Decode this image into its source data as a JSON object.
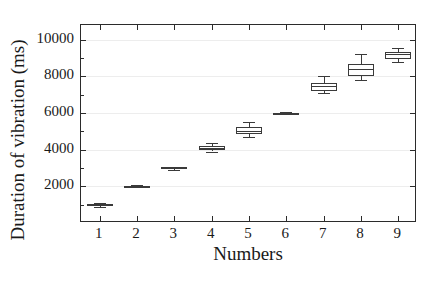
{
  "chart_data": {
    "type": "box",
    "title": "",
    "xlabel": "Numbers",
    "ylabel": "Duration of vibration (ms)",
    "categories": [
      "1",
      "2",
      "3",
      "4",
      "5",
      "6",
      "7",
      "8",
      "9"
    ],
    "xlim": [
      0.5,
      9.5
    ],
    "ylim": [
      0,
      10800
    ],
    "grid": true,
    "legend": null,
    "y_ticks": [
      {
        "value": 2000,
        "label": "2000"
      },
      {
        "value": 4000,
        "label": "4000"
      },
      {
        "value": 6000,
        "label": "6000"
      },
      {
        "value": 8000,
        "label": "8000"
      },
      {
        "value": 10000,
        "label": "10000"
      }
    ],
    "y_minor_ticks": [
      1000,
      3000,
      5000,
      7000,
      9000
    ],
    "boxes": [
      {
        "category": "1",
        "whisker_low": 900,
        "q1": 950,
        "median": 1000,
        "q3": 1050,
        "whisker_high": 1100
      },
      {
        "category": "2",
        "whisker_low": 1960,
        "q1": 1980,
        "median": 2000,
        "q3": 2020,
        "whisker_high": 2050
      },
      {
        "category": "3",
        "whisker_low": 2880,
        "q1": 2930,
        "median": 2990,
        "q3": 3040,
        "whisker_high": 3080
      },
      {
        "category": "4",
        "whisker_low": 3900,
        "q1": 4000,
        "median": 4080,
        "q3": 4180,
        "whisker_high": 4350
      },
      {
        "category": "5",
        "whisker_low": 4700,
        "q1": 4880,
        "median": 5020,
        "q3": 5250,
        "whisker_high": 5500
      },
      {
        "category": "6",
        "whisker_low": 5950,
        "q1": 5975,
        "median": 5995,
        "q3": 6015,
        "whisker_high": 6040
      },
      {
        "category": "7",
        "whisker_low": 7100,
        "q1": 7200,
        "median": 7480,
        "q3": 7640,
        "whisker_high": 8000
      },
      {
        "category": "8",
        "whisker_low": 7800,
        "q1": 8000,
        "median": 8380,
        "q3": 8680,
        "whisker_high": 9200
      },
      {
        "category": "9",
        "whisker_low": 8800,
        "q1": 8950,
        "median": 9200,
        "q3": 9330,
        "whisker_high": 9550
      }
    ],
    "colors": {
      "box_edge": "#3a3a3a",
      "box_fill": "#ffffff",
      "axis": "#2b2b2b",
      "grid": "#ededed",
      "text": "#1a1a1a"
    }
  }
}
